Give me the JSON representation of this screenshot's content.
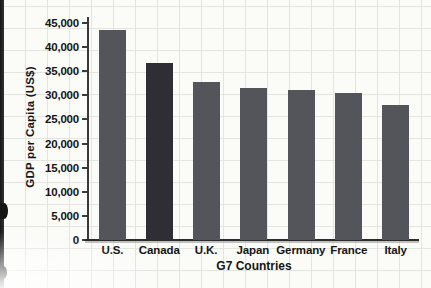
{
  "page": {
    "background": "#fbfbf8",
    "grid_color": "#e3e6df"
  },
  "chart_data": {
    "type": "bar",
    "title": "",
    "xlabel": "G7 Countries",
    "ylabel": "GDP per Capita (US$)",
    "categories": [
      "U.S.",
      "Canada",
      "U.K.",
      "Japan",
      "Germany",
      "France",
      "Italy"
    ],
    "values": [
      43500,
      36700,
      32700,
      31500,
      31200,
      30500,
      28000
    ],
    "bar_colors": [
      "#54545b",
      "#2e2e34",
      "#54545b",
      "#54545b",
      "#54545b",
      "#54545b",
      "#54545b"
    ],
    "ylim": [
      0,
      45000
    ],
    "yticks": [
      0,
      5000,
      10000,
      15000,
      20000,
      25000,
      30000,
      35000,
      40000,
      45000
    ],
    "ytick_labels": [
      "0",
      "5,000",
      "10,000",
      "15,000",
      "20,000",
      "25,000",
      "30,000",
      "35,000",
      "40,000",
      "45,000"
    ],
    "grid": true,
    "legend": false
  }
}
